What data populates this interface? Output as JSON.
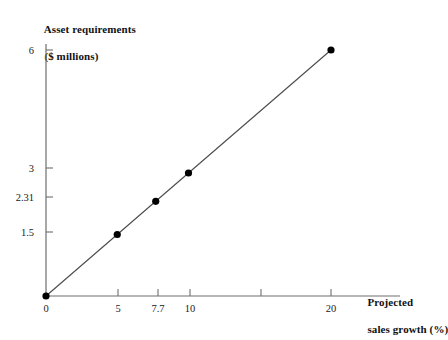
{
  "chart_data": {
    "type": "line",
    "title": "",
    "subtitle": "",
    "xlabel": "Projected sales growth (%)",
    "ylabel": "Asset requirements ($ millions)",
    "ylabel_line1": "Asset requirements",
    "ylabel_line2": "($ millions)",
    "xlabel_line1": "Projected",
    "xlabel_line2": "sales growth (%)",
    "x": [
      0,
      5,
      7.7,
      10,
      20
    ],
    "values": [
      0,
      1.5,
      2.31,
      3,
      6
    ],
    "series": [
      {
        "name": "Asset requirements",
        "x": [
          0,
          5,
          7.7,
          10,
          20
        ],
        "values": [
          0,
          1.5,
          2.31,
          3,
          6
        ],
        "color": "#4d4d4d",
        "marker": "filled-circle",
        "marker_color": "#000000"
      }
    ],
    "xlim": [
      0,
      22.5
    ],
    "ylim": [
      0,
      6.55
    ],
    "xticks": [
      0,
      5,
      7.7,
      10,
      15,
      20
    ],
    "xtick_labels": [
      "0",
      "5",
      "7.7",
      "10",
      "",
      "20"
    ],
    "yticks": [
      0,
      1.5,
      2.31,
      3,
      6
    ],
    "ytick_labels": [
      "",
      "1.5",
      "2.31",
      "3",
      "6"
    ],
    "grid": false,
    "legend": "none",
    "slope": 0.3,
    "annotations": []
  },
  "axes": {
    "y_title_line1": "Asset requirements",
    "y_title_line2": "($ millions)",
    "x_title_line1": "Projected",
    "x_title_line2": "sales growth (%)",
    "y_labels": {
      "t6": "6",
      "t3": "3",
      "t231": "2.31",
      "t15": "1.5"
    },
    "x_labels": {
      "t0": "0",
      "t5": "5",
      "t77": "7.7",
      "t10": "10",
      "t20": "20"
    }
  },
  "colors": {
    "line": "#4d4d4d",
    "marker": "#000000",
    "axis": "#6e6e6e",
    "text": "#111111",
    "background": "#ffffff"
  }
}
